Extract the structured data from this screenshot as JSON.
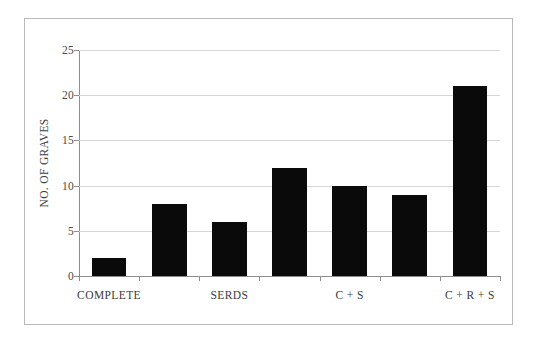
{
  "chart_data": {
    "type": "bar",
    "title": "",
    "subtitle": "",
    "xlabel": "",
    "ylabel": "NO. OF GRAVES",
    "ylim": [
      0,
      25
    ],
    "ytick_values": [
      0,
      5,
      10,
      15,
      20,
      25
    ],
    "ytick_labels": [
      "0",
      "5",
      "10",
      "15",
      "20",
      "25"
    ],
    "grid": "horizontal",
    "legend": "none",
    "bar_color": "#0a0a0a",
    "gridline_color": "#d6d6d6",
    "axis_color": "#8e8e8e",
    "n_bars": 7,
    "values": [
      2,
      8,
      6,
      12,
      10,
      9,
      21
    ],
    "categories": [
      "",
      "",
      "",
      "",
      "",
      "",
      ""
    ],
    "xtick_labels": [
      "COMPLETE",
      "SERDS",
      "C + S",
      "C + R + S"
    ],
    "xtick_label_positions": [
      1,
      3,
      5,
      7
    ],
    "bars": [
      {
        "index": 1,
        "value": 2,
        "label": "COMPLETE"
      },
      {
        "index": 2,
        "value": 8,
        "label": ""
      },
      {
        "index": 3,
        "value": 6,
        "label": "SERDS"
      },
      {
        "index": 4,
        "value": 12,
        "label": ""
      },
      {
        "index": 5,
        "value": 10,
        "label": "C + S"
      },
      {
        "index": 6,
        "value": 9,
        "label": ""
      },
      {
        "index": 7,
        "value": 21,
        "label": "C + R + S"
      }
    ]
  },
  "axis": {
    "y_title": "NO. OF GRAVES",
    "ticks": {
      "t0": "0",
      "t5": "5",
      "t10": "10",
      "t15": "15",
      "t20": "20",
      "t25": "25"
    }
  },
  "x_labels": {
    "l1": "COMPLETE",
    "l2": "SERDS",
    "l3": "C + S",
    "l4": "C + R + S"
  }
}
